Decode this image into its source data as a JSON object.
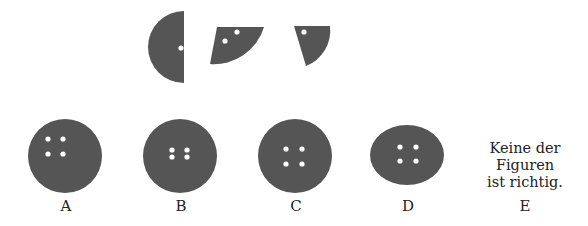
{
  "question": {
    "pieces": [
      {
        "name": "half-circle",
        "holes": 1
      },
      {
        "name": "quarter-sector",
        "holes": 2
      },
      {
        "name": "narrow-sector",
        "holes": 1
      }
    ]
  },
  "options": [
    {
      "label": "A",
      "shape": "circle",
      "holes": 4,
      "hole_pattern": "top-left square"
    },
    {
      "label": "B",
      "shape": "circle",
      "holes": 4,
      "hole_pattern": "center tight square"
    },
    {
      "label": "C",
      "shape": "circle",
      "holes": 4,
      "hole_pattern": "center wide square"
    },
    {
      "label": "D",
      "shape": "ellipse",
      "holes": 4,
      "hole_pattern": "center square"
    },
    {
      "label": "E",
      "text_lines": [
        "Keine der",
        "Figuren",
        "ist richtig."
      ]
    }
  ],
  "colors": {
    "shape_fill": "#555555",
    "hole": "#ffffff",
    "text": "#222222"
  }
}
